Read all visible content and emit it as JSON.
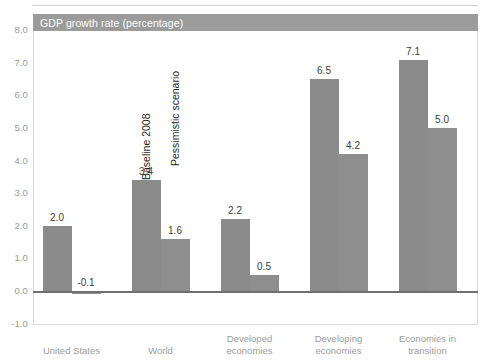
{
  "header": {
    "band_label": "GDP growth rate (percentage)",
    "band_color": "#9b9b9b"
  },
  "chart_data": {
    "type": "bar",
    "title": "GDP growth rate (percentage)",
    "xlabel": "",
    "ylabel": "",
    "ylim": [
      -1.0,
      8.0
    ],
    "yticks": [
      "8.0",
      "7.0",
      "6.0",
      "5.0",
      "4.0",
      "3.0",
      "2.0",
      "1.0",
      "0.0",
      "-1.0"
    ],
    "ytick_values": [
      8.0,
      7.0,
      6.0,
      5.0,
      4.0,
      3.0,
      2.0,
      1.0,
      0.0,
      -1.0
    ],
    "grid": false,
    "legend_position": "in-plot-rotated",
    "bar_color": "#8b8b8b",
    "categories": [
      "United States",
      "World",
      "Developed economies",
      "Developing economies",
      "Economies in transition"
    ],
    "category_lines": [
      [
        "United States"
      ],
      [
        "World"
      ],
      [
        "Developed",
        "economies"
      ],
      [
        "Developing",
        "economies"
      ],
      [
        "Economies in",
        "transition"
      ]
    ],
    "series": [
      {
        "name": "Baseline 2008",
        "values": [
          2.0,
          3.4,
          2.2,
          6.5,
          7.1
        ],
        "labels": [
          "2.0",
          "3.4",
          "2.2",
          "6.5",
          "7.1"
        ]
      },
      {
        "name": "Pessimistic scenario",
        "values": [
          -0.1,
          1.6,
          0.5,
          4.2,
          5.0
        ],
        "labels": [
          "-0.1",
          "1.6",
          "0.5",
          "4.2",
          "5.0"
        ]
      }
    ]
  }
}
